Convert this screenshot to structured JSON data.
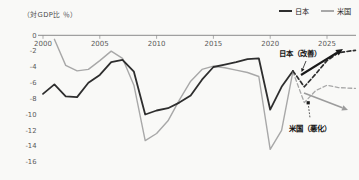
{
  "chart_data": {
    "type": "line",
    "title": "",
    "ylabel": "（対GDP比 ％）",
    "xlabel": "",
    "ylim": [
      -16,
      0
    ],
    "xlim": [
      2000,
      2027.5
    ],
    "yticks": [
      0,
      -2,
      -4,
      -6,
      -8,
      -10,
      -12,
      -14,
      -16
    ],
    "xticks": [
      2000,
      2005,
      2010,
      2015,
      2020,
      2025
    ],
    "grid": false,
    "legend_position": "top-right",
    "colors": {
      "japan": "#2e2e2e",
      "us": "#a8a8a8",
      "axis": "#8a8a8a",
      "tick_label": "#5a5a5a",
      "background": "#f9f9f7",
      "annotation_text": "#111111"
    },
    "legend": [
      {
        "label": "日本",
        "color": "#2e2e2e"
      },
      {
        "label": "米国",
        "color": "#a8a8a8"
      }
    ],
    "series": [
      {
        "name": "米国（実績）",
        "style": "solid",
        "color": "#a8a8a8",
        "width": 1.4,
        "x": [
          2001,
          2002,
          2003,
          2004,
          2005,
          2006,
          2007,
          2008,
          2009,
          2010,
          2011,
          2012,
          2013,
          2014,
          2015,
          2016,
          2017,
          2018,
          2019,
          2020,
          2021,
          2022
        ],
        "y": [
          -0.5,
          -3.8,
          -4.5,
          -4.3,
          -3.2,
          -2.0,
          -2.9,
          -6.3,
          -13.3,
          -12.4,
          -10.8,
          -8.2,
          -5.8,
          -4.3,
          -3.9,
          -4.1,
          -4.4,
          -4.7,
          -5.2,
          -14.4,
          -12.0,
          -4.6
        ]
      },
      {
        "name": "日本（実績）",
        "style": "solid",
        "color": "#2e2e2e",
        "width": 1.8,
        "x": [
          2000,
          2001,
          2002,
          2003,
          2004,
          2005,
          2006,
          2007,
          2008,
          2009,
          2010,
          2011,
          2012,
          2013,
          2014,
          2015,
          2016,
          2017,
          2018,
          2019,
          2020,
          2021,
          2022
        ],
        "y": [
          -7.4,
          -6.2,
          -7.7,
          -7.8,
          -6.0,
          -5.0,
          -3.4,
          -3.1,
          -4.6,
          -10.0,
          -9.5,
          -9.2,
          -8.5,
          -7.6,
          -5.6,
          -4.0,
          -3.7,
          -3.4,
          -3.0,
          -2.9,
          -9.4,
          -6.5,
          -4.5
        ]
      },
      {
        "name": "米国（予測・悪化）",
        "style": "dashed",
        "color": "#a8a8a8",
        "width": 1.3,
        "x": [
          2022,
          2023,
          2024,
          2025,
          2026,
          2027.5
        ],
        "y": [
          -4.6,
          -8.5,
          -7.0,
          -6.3,
          -6.6,
          -6.7
        ]
      },
      {
        "name": "日本（予測・改善）",
        "style": "dashed",
        "color": "#2e2e2e",
        "width": 1.7,
        "x": [
          2022,
          2023,
          2024,
          2025,
          2026,
          2027.5
        ],
        "y": [
          -4.5,
          -6.5,
          -4.9,
          -3.2,
          -2.2,
          -1.9
        ]
      }
    ],
    "annotations": {
      "japan": {
        "text": "日本（改善）",
        "direction": "up"
      },
      "us": {
        "text": "米国（悪化）",
        "direction": "down"
      }
    }
  }
}
